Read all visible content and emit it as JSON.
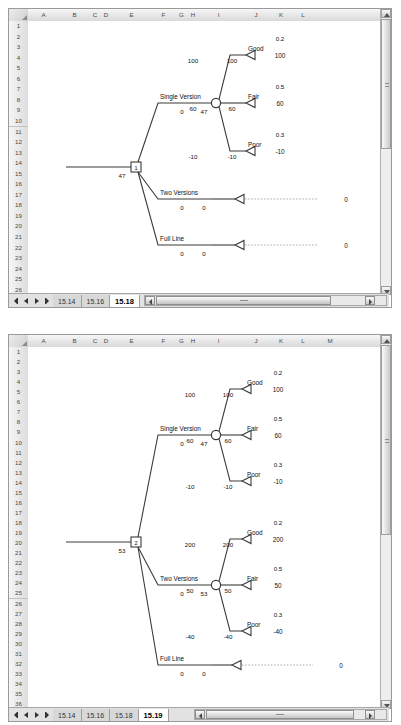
{
  "panels": [
    {
      "id": "panel-top",
      "sheet_tabs": [
        "15.14",
        "15.16",
        "15.18"
      ],
      "active_tab": "15.18",
      "columns": [
        "A",
        "B",
        "C",
        "D",
        "E",
        "F",
        "G",
        "H",
        "I",
        "J",
        "K",
        "L"
      ],
      "row_first": 1,
      "row_last": 26,
      "tree": {
        "root_node_label": "1",
        "root_value": "47",
        "branches": [
          {
            "label": "Single Version",
            "cost": "0",
            "ev": "47",
            "chance_node": true,
            "outcomes": [
              {
                "name": "Good",
                "prob": "0.2",
                "payoff": "100",
                "total": "100",
                "value": "100"
              },
              {
                "name": "Fair",
                "prob": "0.5",
                "payoff": "60",
                "total": "60",
                "value": "60"
              },
              {
                "name": "Poor",
                "prob": "0.3",
                "payoff": "-10",
                "total": "-10",
                "value": "-10"
              }
            ]
          },
          {
            "label": "Two Versions",
            "cost": "0",
            "ev": "0",
            "chance_node": false,
            "value": "0",
            "outcomes": []
          },
          {
            "label": "Full Line",
            "cost": "0",
            "ev": "0",
            "chance_node": false,
            "value": "0",
            "outcomes": []
          }
        ]
      }
    },
    {
      "id": "panel-bottom",
      "sheet_tabs": [
        "15.14",
        "15.16",
        "15.18",
        "15.19"
      ],
      "active_tab": "15.19",
      "columns": [
        "A",
        "B",
        "C",
        "D",
        "E",
        "F",
        "G",
        "H",
        "I",
        "J",
        "K",
        "L",
        "M"
      ],
      "row_first": 1,
      "row_last": 36,
      "tree": {
        "root_node_label": "2",
        "root_value": "53",
        "branches": [
          {
            "label": "Single Version",
            "cost": "0",
            "ev": "47",
            "chance_node": true,
            "outcomes": [
              {
                "name": "Good",
                "prob": "0.2",
                "payoff": "100",
                "total": "100",
                "value": "100"
              },
              {
                "name": "Fair",
                "prob": "0.5",
                "payoff": "60",
                "total": "60",
                "value": "60"
              },
              {
                "name": "Poor",
                "prob": "0.3",
                "payoff": "-10",
                "total": "-10",
                "value": "-10"
              }
            ]
          },
          {
            "label": "Two Versions",
            "cost": "0",
            "ev": "53",
            "chance_node": true,
            "outcomes": [
              {
                "name": "Good",
                "prob": "0.2",
                "payoff": "200",
                "total": "200",
                "value": "200"
              },
              {
                "name": "Fair",
                "prob": "0.5",
                "payoff": "50",
                "total": "50",
                "value": "50"
              },
              {
                "name": "Poor",
                "prob": "0.3",
                "payoff": "-40",
                "total": "-40",
                "value": "-40"
              }
            ]
          },
          {
            "label": "Full Line",
            "cost": "0",
            "ev": "0",
            "chance_node": false,
            "value": "0",
            "outcomes": []
          }
        ]
      }
    }
  ],
  "chart_data": {
    "type": "diagram",
    "diagrams": [
      {
        "name": "15.18",
        "decision_node": {
          "label": "1",
          "ev": 47
        },
        "alternatives": [
          {
            "name": "Single Version",
            "cost": 0,
            "ev": 47,
            "states": [
              {
                "state": "Good",
                "probability": 0.2,
                "payoff": 100,
                "net": 100
              },
              {
                "state": "Fair",
                "probability": 0.5,
                "payoff": 60,
                "net": 60
              },
              {
                "state": "Poor",
                "probability": 0.3,
                "payoff": -10,
                "net": -10
              }
            ]
          },
          {
            "name": "Two Versions",
            "cost": 0,
            "ev": 0,
            "states": []
          },
          {
            "name": "Full Line",
            "cost": 0,
            "ev": 0,
            "states": []
          }
        ]
      },
      {
        "name": "15.19",
        "decision_node": {
          "label": "2",
          "ev": 53
        },
        "alternatives": [
          {
            "name": "Single Version",
            "cost": 0,
            "ev": 47,
            "states": [
              {
                "state": "Good",
                "probability": 0.2,
                "payoff": 100,
                "net": 100
              },
              {
                "state": "Fair",
                "probability": 0.5,
                "payoff": 60,
                "net": 60
              },
              {
                "state": "Poor",
                "probability": 0.3,
                "payoff": -10,
                "net": -10
              }
            ]
          },
          {
            "name": "Two Versions",
            "cost": 0,
            "ev": 53,
            "states": [
              {
                "state": "Good",
                "probability": 0.2,
                "payoff": 200,
                "net": 200
              },
              {
                "state": "Fair",
                "probability": 0.5,
                "payoff": 50,
                "net": 50
              },
              {
                "state": "Poor",
                "probability": 0.3,
                "payoff": -40,
                "net": -40
              }
            ]
          },
          {
            "name": "Full Line",
            "cost": 0,
            "ev": 0,
            "states": []
          }
        ]
      }
    ]
  }
}
